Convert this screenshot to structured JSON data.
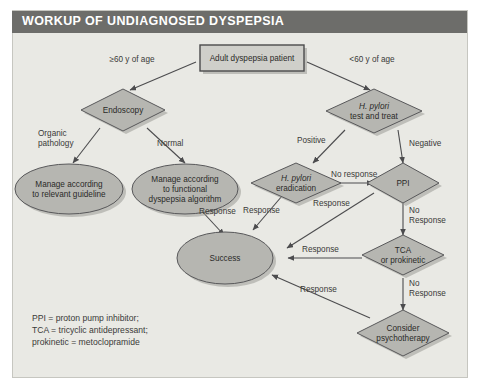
{
  "figure": {
    "title": "WORKUP OF UNDIAGNOSED DYSPEPSIA",
    "title_bar_color": "#6d6d6a",
    "panel_bg_color": "#e9e9e4",
    "shape_fill_color": "#b6b6b1",
    "box_fill_color": "#cfcfca",
    "line_color": "#4c4c4e"
  },
  "nodes": {
    "start": {
      "label": "Adult dyspepsia patient",
      "shape": "rectangle"
    },
    "endoscopy": {
      "label": "Endoscopy",
      "shape": "diamond"
    },
    "hpylori_test": {
      "label_line1": "H. pylori",
      "label_line2": "test and treat",
      "shape": "diamond"
    },
    "manage_guideline": {
      "label_line1": "Manage according",
      "label_line2": "to relevant guideline",
      "shape": "ellipse"
    },
    "manage_functional": {
      "label_line1": "Manage according",
      "label_line2": "to functional",
      "label_line3": "dyspepsia algorithm",
      "shape": "ellipse"
    },
    "hpylori_eradication": {
      "label_line1": "H. pylori",
      "label_line2": "eradication",
      "shape": "diamond"
    },
    "ppi": {
      "label": "PPI",
      "shape": "diamond"
    },
    "tca": {
      "label_line1": "TCA",
      "label_line2": "or prokinetic",
      "shape": "diamond"
    },
    "psychotherapy": {
      "label_line1": "Consider",
      "label_line2": "psychotherapy",
      "shape": "diamond"
    },
    "success": {
      "label": "Success",
      "shape": "ellipse"
    }
  },
  "edge_labels": {
    "age_over60": "≥60 y of age",
    "age_under60": "<60 y of age",
    "organic_pathology_l1": "Organic",
    "organic_pathology_l2": "pathology",
    "normal": "Normal",
    "positive": "Positive",
    "negative": "Negative",
    "no_response_hpylori": "No response",
    "response_functional": "Response",
    "response_hpylori": "Response",
    "response_ppi": "Response",
    "response_tca": "Response",
    "no_response_ppi_l1": "No",
    "no_response_ppi_l2": "Response",
    "no_response_tca_l1": "No",
    "no_response_tca_l2": "Response"
  },
  "legend": {
    "line1": "PPI = proton pump inhibitor;",
    "line2": "TCA = tricyclic antidepressant;",
    "line3": "prokinetic = metoclopramide"
  }
}
